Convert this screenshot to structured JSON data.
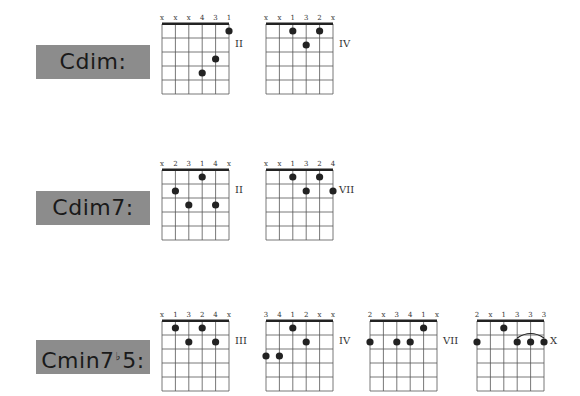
{
  "chords": [
    {
      "name": "Cdim:",
      "name_parts": [
        "Cdim:"
      ],
      "diagrams": [
        {
          "top_labels": [
            "x",
            "x",
            "x",
            "4",
            "3",
            "1"
          ],
          "position": "II",
          "dots": [
            {
              "string": 6,
              "fret": 1
            },
            {
              "string": 5,
              "fret": 3
            },
            {
              "string": 4,
              "fret": 4
            }
          ],
          "barre": null
        },
        {
          "top_labels": [
            "x",
            "x",
            "1",
            "3",
            "2",
            "x"
          ],
          "position": "IV",
          "dots": [
            {
              "string": 3,
              "fret": 1
            },
            {
              "string": 5,
              "fret": 1
            },
            {
              "string": 4,
              "fret": 2
            }
          ],
          "barre": null
        }
      ]
    },
    {
      "name": "Cdim7:",
      "name_parts": [
        "Cdim7:"
      ],
      "diagrams": [
        {
          "top_labels": [
            "x",
            "2",
            "3",
            "1",
            "4",
            "x"
          ],
          "position": "II",
          "dots": [
            {
              "string": 4,
              "fret": 1
            },
            {
              "string": 2,
              "fret": 2
            },
            {
              "string": 3,
              "fret": 3
            },
            {
              "string": 5,
              "fret": 3
            }
          ],
          "barre": null
        },
        {
          "top_labels": [
            "x",
            "x",
            "1",
            "3",
            "2",
            "4"
          ],
          "position": "VII",
          "dots": [
            {
              "string": 3,
              "fret": 1
            },
            {
              "string": 5,
              "fret": 1
            },
            {
              "string": 4,
              "fret": 2
            },
            {
              "string": 6,
              "fret": 2
            }
          ],
          "barre": null
        }
      ]
    },
    {
      "name": "Cmin7♭5:",
      "name_parts": [
        "Cmin7",
        "♭",
        "5:"
      ],
      "diagrams": [
        {
          "top_labels": [
            "x",
            "1",
            "3",
            "2",
            "4",
            "x"
          ],
          "position": "III",
          "dots": [
            {
              "string": 2,
              "fret": 1
            },
            {
              "string": 4,
              "fret": 1
            },
            {
              "string": 3,
              "fret": 2
            },
            {
              "string": 5,
              "fret": 2
            }
          ],
          "barre": null
        },
        {
          "top_labels": [
            "3",
            "4",
            "1",
            "2",
            "x",
            "x"
          ],
          "position": "IV",
          "dots": [
            {
              "string": 3,
              "fret": 1
            },
            {
              "string": 4,
              "fret": 2
            },
            {
              "string": 1,
              "fret": 3
            },
            {
              "string": 2,
              "fret": 3
            }
          ],
          "barre": null
        },
        {
          "top_labels": [
            "2",
            "x",
            "3",
            "4",
            "1",
            "x"
          ],
          "position": "VII",
          "dots": [
            {
              "string": 5,
              "fret": 1
            },
            {
              "string": 1,
              "fret": 2
            },
            {
              "string": 3,
              "fret": 2
            },
            {
              "string": 4,
              "fret": 2
            }
          ],
          "barre": null
        },
        {
          "top_labels": [
            "2",
            "x",
            "1",
            "3",
            "3",
            "3"
          ],
          "position": "X",
          "dots": [
            {
              "string": 3,
              "fret": 1
            },
            {
              "string": 1,
              "fret": 2
            },
            {
              "string": 4,
              "fret": 2
            },
            {
              "string": 5,
              "fret": 2
            },
            {
              "string": 6,
              "fret": 2
            }
          ],
          "barre": {
            "from_string": 4,
            "to_string": 6,
            "fret": 2
          }
        }
      ]
    }
  ],
  "style": {
    "label_bg": "#8c8c8c",
    "label_text": "#1a1a1a",
    "line": "#555555",
    "dot": "#222222"
  }
}
